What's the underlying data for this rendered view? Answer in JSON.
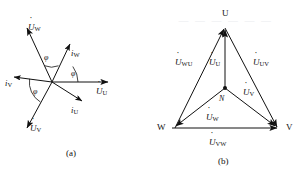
{
  "figure": {
    "width": 302,
    "height": 174,
    "background": "#ffffff",
    "stroke_color": "#111111",
    "panels": [
      {
        "id": "a",
        "caption": "(a)",
        "type": "phasor-star-diagram",
        "description": "Three-phase voltage and current phasor star diagram with phase angle phi between each voltage and its current"
      },
      {
        "id": "b",
        "caption": "(b)",
        "type": "phasor-triangle-diagram",
        "description": "Three-phase phasor triangle with neutral point N, phase voltages and line voltages"
      }
    ]
  },
  "panel_a": {
    "caption": "(a)",
    "origin_label": "",
    "vectors": [
      {
        "name": "voltage-u",
        "base": "U",
        "dot": true,
        "subscript": "U",
        "label_x": 96,
        "label_y": 87
      },
      {
        "name": "voltage-v",
        "base": "U",
        "dot": true,
        "subscript": "V",
        "label_x": 30,
        "label_y": 124
      },
      {
        "name": "voltage-w",
        "base": "U",
        "dot": true,
        "subscript": "W",
        "label_x": 28,
        "label_y": 23
      },
      {
        "name": "current-u",
        "base": "i",
        "dot": false,
        "subscript": "U",
        "label_x": 71,
        "label_y": 106
      },
      {
        "name": "current-v",
        "base": "i",
        "dot": false,
        "subscript": "V",
        "label_x": 5,
        "label_y": 79
      },
      {
        "name": "current-w",
        "base": "i",
        "dot": false,
        "subscript": "W",
        "label_x": 71,
        "label_y": 49
      }
    ],
    "angles": [
      {
        "name": "phi-u",
        "label": "φ",
        "x": 71,
        "y": 83
      },
      {
        "name": "phi-v",
        "label": "φ",
        "x": 33,
        "y": 90
      },
      {
        "name": "phi-w",
        "label": "φ",
        "x": 44,
        "y": 57
      }
    ]
  },
  "panel_b": {
    "caption": "(b)",
    "vertices": [
      {
        "name": "vertex-u",
        "label": "U",
        "x": 222,
        "y": 9
      },
      {
        "name": "vertex-w",
        "label": "W",
        "x": 157,
        "y": 124
      },
      {
        "name": "vertex-v",
        "label": "V",
        "x": 287,
        "y": 124
      },
      {
        "name": "node-n",
        "label": "N",
        "x": 219,
        "y": 96
      }
    ],
    "phase_voltages": [
      {
        "name": "phase-voltage-u",
        "base": "U",
        "dot": true,
        "subscript": "U",
        "label_x": 209,
        "label_y": 58
      },
      {
        "name": "phase-voltage-v",
        "base": "U",
        "dot": true,
        "subscript": "V",
        "label_x": 243,
        "label_y": 88
      },
      {
        "name": "phase-voltage-w",
        "base": "U",
        "dot": true,
        "subscript": "W",
        "label_x": 206,
        "label_y": 114
      }
    ],
    "line_voltages": [
      {
        "name": "line-voltage-wu",
        "base": "U",
        "dot": true,
        "subscript": "WU",
        "label_x": 176,
        "label_y": 58
      },
      {
        "name": "line-voltage-uv",
        "base": "U",
        "dot": true,
        "subscript": "UV",
        "label_x": 254,
        "label_y": 58
      },
      {
        "name": "line-voltage-vw",
        "base": "U",
        "dot": true,
        "subscript": "VW",
        "label_x": 209,
        "label_y": 139
      }
    ]
  },
  "watermark": {
    "text": "— — — — — —",
    "x": 178,
    "y": 14
  }
}
